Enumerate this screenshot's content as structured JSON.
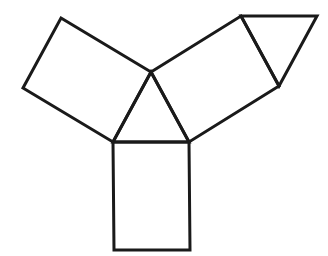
{
  "diagram": {
    "width": 328,
    "height": 256,
    "background": "#ffffff",
    "stroke_color": "#1a1a1a",
    "shapes": [
      {
        "id": "central-triangle",
        "type": "triangle",
        "points": [
          [
            151,
            72
          ],
          [
            113,
            142
          ],
          [
            189,
            142
          ]
        ]
      },
      {
        "id": "left-rectangle",
        "type": "rectangle",
        "points": [
          [
            61,
            18
          ],
          [
            151,
            72
          ],
          [
            113,
            142
          ],
          [
            23,
            88
          ]
        ]
      },
      {
        "id": "right-rectangle",
        "type": "rectangle",
        "points": [
          [
            151,
            72
          ],
          [
            241,
            16
          ],
          [
            279,
            86
          ],
          [
            189,
            142
          ]
        ]
      },
      {
        "id": "bottom-rectangle",
        "type": "rectangle",
        "points": [
          [
            113,
            142
          ],
          [
            189,
            142
          ],
          [
            190,
            250
          ],
          [
            114,
            250
          ]
        ]
      },
      {
        "id": "top-right-triangle",
        "type": "triangle",
        "points": [
          [
            241,
            16
          ],
          [
            317,
            16
          ],
          [
            279,
            86
          ]
        ]
      }
    ]
  }
}
